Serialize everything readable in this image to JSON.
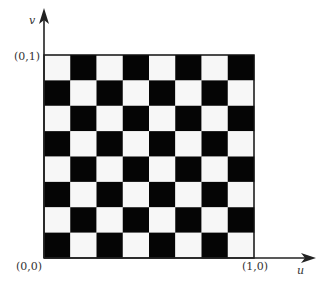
{
  "figure": {
    "grid": {
      "rows": 8,
      "cols": 8,
      "top_left_color": "white",
      "colors": {
        "light": "#f7f7f7",
        "dark": "#050505",
        "border": "#111111"
      }
    },
    "axes": {
      "horizontal": {
        "name": "u"
      },
      "vertical": {
        "name": "v"
      }
    },
    "corner_labels": {
      "origin": "(0,0)",
      "top_left": "(0,1)",
      "bottom_right": "(1,0)"
    }
  }
}
